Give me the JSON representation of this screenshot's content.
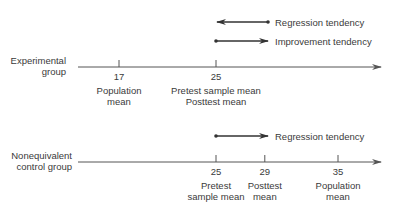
{
  "experimental": {
    "group_label": [
      "Experimental",
      "group"
    ],
    "ticks": [
      {
        "value": 17,
        "label": "17",
        "caption": [
          "Population",
          "mean"
        ]
      },
      {
        "value": 25,
        "label": "25",
        "caption": [
          "Pretest sample mean",
          "Posttest mean"
        ]
      }
    ],
    "tendencies": [
      {
        "label": "Regression tendency",
        "direction": "left",
        "from": 25
      },
      {
        "label": "Improvement tendency",
        "direction": "right",
        "from": 25
      }
    ]
  },
  "control": {
    "group_label": [
      "Nonequivalent",
      "control group"
    ],
    "ticks": [
      {
        "value": 25,
        "label": "25",
        "caption": [
          "Pretest",
          "sample mean"
        ]
      },
      {
        "value": 29,
        "label": "29",
        "caption": [
          "Posttest",
          "mean"
        ]
      },
      {
        "value": 35,
        "label": "35",
        "caption": [
          "Population",
          "mean"
        ]
      }
    ],
    "tendencies": [
      {
        "label": "Regression tendency",
        "direction": "right",
        "from": 25
      }
    ]
  },
  "colors": {
    "line": "#555555",
    "arrow": "#333333",
    "text": "#3a3a3a"
  }
}
